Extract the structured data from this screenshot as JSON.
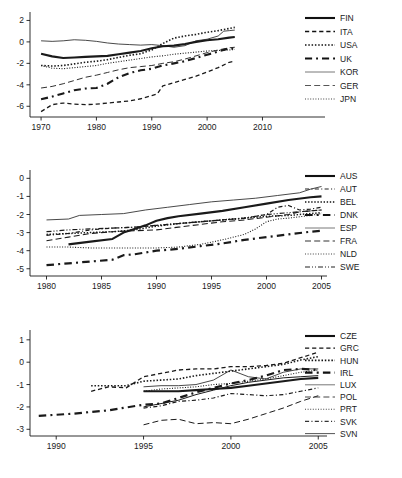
{
  "figure": {
    "title": "",
    "panel_count": 3
  },
  "chart_data": [
    {
      "id": "panel-1",
      "type": "line",
      "title": "",
      "xlabel": "",
      "ylabel": "",
      "xlim": [
        1968,
        2011
      ],
      "ylim": [
        -7.0,
        2.6
      ],
      "xticks": [
        1970,
        1980,
        1990,
        2000,
        2010
      ],
      "xtick_labels": [
        "1970",
        "1980",
        "1990",
        "2000",
        "2010"
      ],
      "yticks": [
        2,
        0,
        -2,
        -4,
        -6
      ],
      "ytick_labels": [
        "2",
        "0",
        "-2",
        "-4",
        "-6"
      ],
      "grid": false,
      "legend_position": "right",
      "series": [
        {
          "name": "FIN",
          "style": "solid",
          "width": 2.1,
          "color": "#111111",
          "x": [
            1970,
            1972,
            1974,
            1976,
            1978,
            1980,
            1982,
            1984,
            1986,
            1988,
            1990,
            1992,
            1994,
            1996,
            1998,
            2000,
            2002,
            2004,
            2005
          ],
          "values": [
            -1.1,
            -1.35,
            -1.5,
            -1.45,
            -1.4,
            -1.35,
            -1.3,
            -1.15,
            -1.0,
            -0.85,
            -0.6,
            -0.4,
            -0.35,
            -0.2,
            0.0,
            0.15,
            0.25,
            0.4,
            0.45
          ]
        },
        {
          "name": "ITA",
          "style": "dashed",
          "width": 1.3,
          "color": "#111111",
          "x": [
            1970,
            1972,
            1974,
            1976,
            1978,
            1980,
            1982,
            1984,
            1986,
            1988,
            1990,
            1991,
            1992,
            1994,
            1996,
            1998,
            2000,
            2002,
            2004,
            2005
          ],
          "values": [
            -6.5,
            -5.85,
            -5.7,
            -5.8,
            -5.85,
            -5.8,
            -5.7,
            -5.6,
            -5.5,
            -5.3,
            -5.0,
            -4.85,
            -4.1,
            -3.8,
            -3.5,
            -3.2,
            -2.8,
            -2.4,
            -1.9,
            -1.8
          ]
        },
        {
          "name": "USA",
          "style": "dotted",
          "width": 1.6,
          "color": "#111111",
          "x": [
            1970,
            1972,
            1974,
            1976,
            1978,
            1980,
            1982,
            1984,
            1986,
            1988,
            1990,
            1992,
            1994,
            1996,
            1998,
            2000,
            2002,
            2004,
            2005
          ],
          "values": [
            -2.2,
            -2.25,
            -2.2,
            -2.05,
            -1.9,
            -1.8,
            -1.65,
            -1.45,
            -1.25,
            -1.1,
            -0.75,
            -0.15,
            0.35,
            0.55,
            0.7,
            0.9,
            1.05,
            1.25,
            1.35
          ]
        },
        {
          "name": "UK",
          "style": "dashdot",
          "width": 2.1,
          "color": "#111111",
          "x": [
            1970,
            1972,
            1974,
            1976,
            1978,
            1980,
            1982,
            1984,
            1986,
            1988,
            1990,
            1992,
            1994,
            1996,
            1998,
            2000,
            2002,
            2004,
            2005
          ],
          "values": [
            -5.35,
            -5.1,
            -4.8,
            -4.5,
            -4.35,
            -4.3,
            -3.9,
            -3.3,
            -2.9,
            -2.65,
            -2.5,
            -2.2,
            -2.0,
            -1.8,
            -1.5,
            -1.2,
            -0.9,
            -0.6,
            -0.65
          ]
        },
        {
          "name": "KOR",
          "style": "solid",
          "width": 0.8,
          "color": "#555555",
          "x": [
            1970,
            1972,
            1974,
            1976,
            1978,
            1980,
            1982,
            1984,
            1986,
            1988,
            1990,
            1992,
            1994,
            1996,
            1998,
            2000,
            2002,
            2003,
            2004,
            2005
          ],
          "values": [
            0.1,
            0.05,
            0.1,
            0.2,
            0.15,
            0.05,
            -0.1,
            -0.2,
            -0.25,
            -0.3,
            -0.25,
            -0.35,
            -0.5,
            -0.35,
            0.1,
            0.25,
            0.55,
            1.0,
            1.05,
            1.1
          ]
        },
        {
          "name": "GER",
          "style": "longdash",
          "width": 0.9,
          "color": "#444444",
          "x": [
            1970,
            1972,
            1974,
            1976,
            1978,
            1980,
            1982,
            1984,
            1986,
            1988,
            1990,
            1992,
            1994,
            1996,
            1998,
            2000,
            2002,
            2004,
            2005
          ],
          "values": [
            -4.3,
            -4.15,
            -3.9,
            -3.6,
            -3.3,
            -3.1,
            -2.85,
            -2.6,
            -2.4,
            -2.3,
            -2.2,
            -2.0,
            -1.85,
            -1.6,
            -1.3,
            -1.0,
            -0.75,
            -0.55,
            -0.5
          ]
        },
        {
          "name": "JPN",
          "style": "finedot",
          "width": 1.1,
          "color": "#444444",
          "x": [
            1970,
            1972,
            1974,
            1976,
            1978,
            1980,
            1982,
            1984,
            1986,
            1988,
            1990,
            1992,
            1994,
            1996,
            1998,
            2000,
            2002,
            2004,
            2005
          ],
          "values": [
            -2.2,
            -2.45,
            -2.5,
            -2.4,
            -2.3,
            -2.2,
            -2.0,
            -1.85,
            -1.7,
            -1.55,
            -1.4,
            -1.3,
            -1.15,
            -1.05,
            -0.95,
            -0.85,
            -0.8,
            -0.75,
            -0.7
          ]
        }
      ]
    },
    {
      "id": "panel-2",
      "type": "line",
      "title": "",
      "xlabel": "",
      "ylabel": "",
      "xlim": [
        1978.5,
        2005.5
      ],
      "ylim": [
        -5.4,
        0.35
      ],
      "xticks": [
        1980,
        1985,
        1990,
        1995,
        2000,
        2005
      ],
      "xtick_labels": [
        "1980",
        "1985",
        "1990",
        "1995",
        "2000",
        "2005"
      ],
      "yticks": [
        0,
        -1,
        -2,
        -3,
        -4,
        -5
      ],
      "ytick_labels": [
        "0",
        "-1",
        "-2",
        "-3",
        "-4",
        "-5"
      ],
      "grid": false,
      "legend_position": "right",
      "series": [
        {
          "name": "AUS",
          "style": "solid",
          "width": 2.1,
          "color": "#111111",
          "x": [
            1982,
            1984,
            1986,
            1987,
            1988,
            1989,
            1990,
            1991,
            1992,
            1994,
            1996,
            1998,
            2000,
            2002,
            2004,
            2005
          ],
          "values": [
            -3.65,
            -3.5,
            -3.35,
            -3.0,
            -2.8,
            -2.6,
            -2.35,
            -2.2,
            -2.1,
            -1.95,
            -1.8,
            -1.6,
            -1.4,
            -1.2,
            -1.05,
            -1.0
          ]
        },
        {
          "name": "AUT",
          "style": "dashdot",
          "width": 1.2,
          "color": "#222222",
          "x": [
            1980,
            1982,
            1984,
            1986,
            1988,
            1990,
            1992,
            1994,
            1996,
            1998,
            2000,
            2001,
            2002,
            2003,
            2004,
            2005
          ],
          "values": [
            -3.15,
            -3.05,
            -2.85,
            -2.75,
            -2.7,
            -2.6,
            -2.5,
            -2.4,
            -2.3,
            -2.2,
            -2.0,
            -1.6,
            -1.5,
            -1.75,
            -1.7,
            -1.6
          ]
        },
        {
          "name": "BEL",
          "style": "dotted",
          "width": 1.5,
          "color": "#111111",
          "x": [
            1980,
            1982,
            1984,
            1986,
            1988,
            1990,
            1992,
            1994,
            1996,
            1998,
            2000,
            2002,
            2004,
            2005
          ],
          "values": [
            -3.1,
            -3.05,
            -3.0,
            -2.95,
            -2.85,
            -2.65,
            -2.5,
            -2.4,
            -2.3,
            -2.2,
            -2.1,
            -2.05,
            -1.95,
            -1.9
          ]
        },
        {
          "name": "DNK",
          "style": "dashdot",
          "width": 2.2,
          "color": "#111111",
          "x": [
            1980,
            1982,
            1984,
            1986,
            1987,
            1988,
            1990,
            1992,
            1994,
            1996,
            1998,
            2000,
            2002,
            2004,
            2005
          ],
          "values": [
            -4.8,
            -4.7,
            -4.6,
            -4.5,
            -4.25,
            -4.2,
            -4.0,
            -3.9,
            -3.75,
            -3.6,
            -3.4,
            -3.25,
            -3.1,
            -2.95,
            -2.9
          ]
        },
        {
          "name": "ESP",
          "style": "solid",
          "width": 0.8,
          "color": "#555555",
          "x": [
            1980,
            1982,
            1983,
            1985,
            1987,
            1989,
            1991,
            1993,
            1995,
            1997,
            1999,
            2001,
            2003,
            2004,
            2005
          ],
          "values": [
            -2.3,
            -2.25,
            -2.05,
            -2.0,
            -1.95,
            -1.75,
            -1.6,
            -1.45,
            -1.3,
            -1.2,
            -1.1,
            -0.95,
            -0.8,
            -0.6,
            -0.45
          ]
        },
        {
          "name": "FRA",
          "style": "longdash",
          "width": 1.1,
          "color": "#333333",
          "x": [
            1980,
            1982,
            1984,
            1986,
            1988,
            1990,
            1992,
            1994,
            1996,
            1998,
            2000,
            2002,
            2003,
            2004,
            2005
          ],
          "values": [
            -3.45,
            -3.25,
            -3.05,
            -2.95,
            -2.9,
            -2.85,
            -2.7,
            -2.55,
            -2.4,
            -2.3,
            -2.15,
            -2.0,
            -1.85,
            -1.8,
            -1.75
          ]
        },
        {
          "name": "NLD",
          "style": "finedot",
          "width": 1.1,
          "color": "#444444",
          "x": [
            1980,
            1982,
            1984,
            1986,
            1988,
            1990,
            1992,
            1994,
            1996,
            1998,
            1999,
            2000,
            2001,
            2002,
            2004,
            2005
          ],
          "values": [
            -3.8,
            -3.8,
            -3.85,
            -3.85,
            -3.85,
            -3.85,
            -3.8,
            -3.65,
            -3.4,
            -3.1,
            -2.8,
            -2.4,
            -2.25,
            -2.2,
            -2.05,
            -1.95
          ]
        },
        {
          "name": "SWE",
          "style": "dashdotdot",
          "width": 1.2,
          "color": "#222222",
          "x": [
            1980,
            1982,
            1984,
            1986,
            1988,
            1990,
            1992,
            1994,
            1996,
            1998,
            2000,
            2002,
            2004,
            2005
          ],
          "values": [
            -2.95,
            -2.85,
            -2.8,
            -2.75,
            -2.7,
            -2.6,
            -2.5,
            -2.4,
            -2.3,
            -2.2,
            -2.0,
            -1.9,
            -1.8,
            -1.75
          ]
        }
      ]
    },
    {
      "id": "panel-3",
      "type": "line",
      "title": "",
      "xlabel": "",
      "ylabel": "",
      "xlim": [
        1988.5,
        2005.5
      ],
      "ylim": [
        -3.3,
        1.35
      ],
      "xticks": [
        1990,
        1995,
        2000,
        2005
      ],
      "xtick_labels": [
        "1990",
        "1995",
        "2000",
        "2005"
      ],
      "yticks": [
        1,
        0,
        -1,
        -2,
        -3
      ],
      "ytick_labels": [
        "1",
        "0",
        "-1",
        "-2",
        "-3"
      ],
      "grid": false,
      "legend_position": "right",
      "series": [
        {
          "name": "CZE",
          "style": "solid",
          "width": 2.1,
          "color": "#111111",
          "x": [
            1995,
            1996,
            1997,
            1998,
            1999,
            2000,
            2001,
            2002,
            2003,
            2004,
            2005
          ],
          "values": [
            -1.3,
            -1.3,
            -1.3,
            -1.25,
            -1.2,
            -1.15,
            -1.05,
            -0.95,
            -0.85,
            -0.75,
            -0.7
          ]
        },
        {
          "name": "GRC",
          "style": "dashed",
          "width": 1.3,
          "color": "#111111",
          "x": [
            1992,
            1993,
            1994,
            1995,
            1996,
            1997,
            1998,
            1999,
            2000,
            2001,
            2002,
            2003,
            2004,
            2005
          ],
          "values": [
            -1.3,
            -1.1,
            -1.15,
            -0.65,
            -0.5,
            -0.35,
            -0.3,
            -0.3,
            -0.2,
            -0.2,
            -0.15,
            -0.05,
            0.2,
            0.45
          ]
        },
        {
          "name": "HUN",
          "style": "dotted",
          "width": 1.6,
          "color": "#111111",
          "x": [
            1992,
            1994,
            1995,
            1996,
            1997,
            1998,
            1999,
            2000,
            2001,
            2002,
            2003,
            2004,
            2005
          ],
          "values": [
            -1.05,
            -1.05,
            -0.85,
            -0.8,
            -0.75,
            -0.6,
            -0.5,
            -0.4,
            -0.3,
            -0.2,
            -0.1,
            0.1,
            0.25
          ]
        },
        {
          "name": "IRL",
          "style": "dashdot",
          "width": 2.2,
          "color": "#111111",
          "x": [
            1989,
            1991,
            1993,
            1995,
            1996,
            1997,
            1998,
            1999,
            2000,
            2001,
            2002,
            2003,
            2004,
            2005
          ],
          "values": [
            -2.4,
            -2.3,
            -2.15,
            -1.9,
            -1.85,
            -1.6,
            -1.35,
            -1.15,
            -0.95,
            -0.8,
            -0.6,
            -0.35,
            -0.3,
            -0.35
          ]
        },
        {
          "name": "LUX",
          "style": "solid",
          "width": 0.8,
          "color": "#555555",
          "x": [
            1995,
            1996,
            1997,
            1998,
            1999,
            2000,
            2001,
            2002,
            2003,
            2004,
            2005
          ],
          "values": [
            -1.1,
            -1.05,
            -1.05,
            -1.0,
            -0.8,
            -0.35,
            -0.65,
            -0.75,
            -0.45,
            -0.3,
            -0.3
          ]
        },
        {
          "name": "POL",
          "style": "longdash",
          "width": 1.0,
          "color": "#444444",
          "x": [
            1995,
            1996,
            1997,
            1998,
            1999,
            2000,
            2001,
            2002,
            2003,
            2004,
            2005
          ],
          "values": [
            -2.8,
            -2.6,
            -2.55,
            -2.75,
            -2.7,
            -2.75,
            -2.55,
            -2.3,
            -2.05,
            -1.75,
            -1.5
          ]
        },
        {
          "name": "PRT",
          "style": "finedot",
          "width": 1.1,
          "color": "#444444",
          "x": [
            1995,
            1996,
            1997,
            1998,
            1999,
            2000,
            2001,
            2002,
            2003,
            2004,
            2005
          ],
          "values": [
            -1.3,
            -1.2,
            -1.15,
            -1.1,
            -1.0,
            -0.95,
            -0.85,
            -0.75,
            -0.6,
            -0.45,
            -0.35
          ]
        },
        {
          "name": "SVK",
          "style": "dashdot",
          "width": 1.2,
          "color": "#333333",
          "x": [
            1995,
            1996,
            1997,
            1998,
            1999,
            2000,
            2001,
            2002,
            2003,
            2004,
            2005
          ],
          "values": [
            -2.05,
            -1.95,
            -1.75,
            -1.7,
            -1.6,
            -1.4,
            -1.45,
            -1.5,
            -1.45,
            -1.3,
            -1.15
          ]
        },
        {
          "name": "SVN",
          "style": "solid",
          "width": 1.0,
          "color": "#555555",
          "x": [
            1995,
            1996,
            1997,
            1998,
            1999,
            2000,
            2001,
            2002,
            2003,
            2004,
            2005
          ],
          "values": [
            -2.0,
            -1.85,
            -1.7,
            -1.45,
            -1.25,
            -1.05,
            -0.9,
            -0.8,
            -0.7,
            -0.65,
            -0.6
          ]
        }
      ]
    }
  ]
}
